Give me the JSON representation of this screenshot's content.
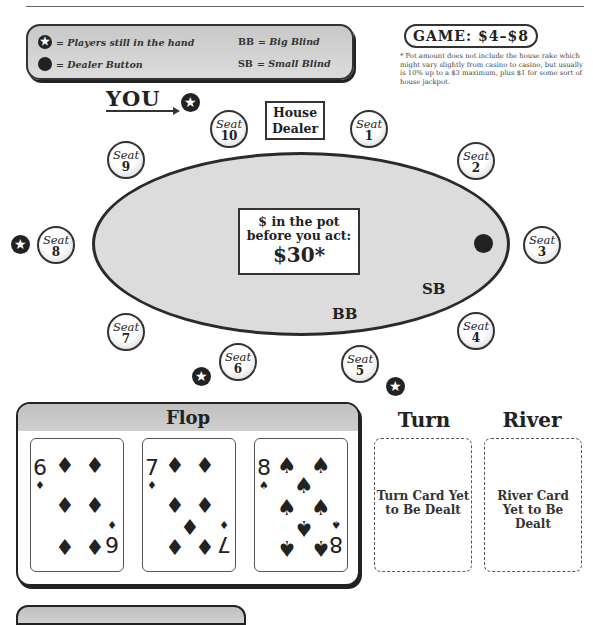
{
  "legend": {
    "star_label": "= Players still in the hand",
    "dot_label": "= Dealer Button",
    "bb_abbr": "BB",
    "bb_label": "= Big Blind",
    "sb_abbr": "SB",
    "sb_label": "= Small Blind",
    "star_glyph": "✪"
  },
  "game": {
    "label": "GAME: $4–$8"
  },
  "footnote": "* Pot amount does not include the house rake which might vary slightly from casino to casino, but usually is 10% up to a $3 maximum, plus $1 for some sort of house jackpot.",
  "you_label": "YOU",
  "dealer": {
    "line1": "House",
    "line2": "Dealer"
  },
  "pot": {
    "line1": "$ in the pot",
    "line2": "before you act:",
    "amount": "$30*"
  },
  "blinds": {
    "bb": "BB",
    "sb": "SB"
  },
  "seat_word": "Seat",
  "seats": [
    {
      "num": "1"
    },
    {
      "num": "2"
    },
    {
      "num": "3"
    },
    {
      "num": "4"
    },
    {
      "num": "5"
    },
    {
      "num": "6"
    },
    {
      "num": "7"
    },
    {
      "num": "8"
    },
    {
      "num": "9"
    },
    {
      "num": "10"
    }
  ],
  "star_glyph": "★",
  "flop": {
    "title": "Flop",
    "cards": [
      {
        "rank": "6",
        "suit": "♦"
      },
      {
        "rank": "7",
        "suit": "♦"
      },
      {
        "rank": "8",
        "suit": "♠"
      }
    ]
  },
  "turn": {
    "title": "Turn",
    "placeholder": "Turn Card Yet to Be Dealt"
  },
  "river": {
    "title": "River",
    "placeholder": "River Card Yet to Be Dealt"
  }
}
